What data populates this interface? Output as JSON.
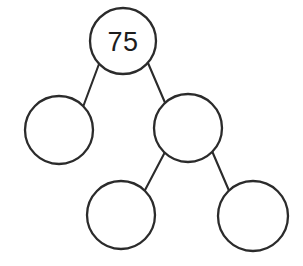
{
  "diagram": {
    "type": "binary-tree",
    "background_color": "#ffffff",
    "stroke_color": "#2b2b2b",
    "label_color": "#1d1d1d",
    "canvas": {
      "width": 303,
      "height": 266
    },
    "nodes": [
      {
        "id": "root",
        "label": "75",
        "has_label": true,
        "cx": 123,
        "cy": 41,
        "r": 33
      },
      {
        "id": "left-child",
        "label": "",
        "has_label": false,
        "cx": 59,
        "cy": 130,
        "r": 34
      },
      {
        "id": "right-child",
        "label": "",
        "has_label": false,
        "cx": 188,
        "cy": 128,
        "r": 34
      },
      {
        "id": "right-left-grandchild",
        "label": "",
        "has_label": false,
        "cx": 121,
        "cy": 215,
        "r": 34
      },
      {
        "id": "right-right-grandchild",
        "label": "",
        "has_label": false,
        "cx": 253,
        "cy": 216,
        "r": 35
      }
    ],
    "edges": [
      {
        "id": "edge-root-left",
        "from": "root",
        "to": "left-child",
        "x1": 99,
        "y1": 64,
        "x2": 83,
        "y2": 107
      },
      {
        "id": "edge-root-right",
        "from": "root",
        "to": "right-child",
        "x1": 148,
        "y1": 63,
        "x2": 166,
        "y2": 105
      },
      {
        "id": "edge-right-left",
        "from": "right-child",
        "to": "right-left-grandchild",
        "x1": 165,
        "y1": 152,
        "x2": 144,
        "y2": 192
      },
      {
        "id": "edge-right-right",
        "from": "right-child",
        "to": "right-right-grandchild",
        "x1": 212,
        "y1": 151,
        "x2": 230,
        "y2": 193
      }
    ]
  }
}
